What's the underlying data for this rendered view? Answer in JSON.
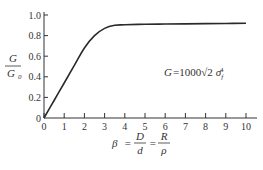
{
  "chart_data": {
    "type": "line",
    "title": "",
    "xlabel": "β = D/d = R/ρ",
    "ylabel": "G/G0",
    "xlim": [
      0,
      10
    ],
    "ylim": [
      0,
      1.0
    ],
    "grid": false,
    "legend": null,
    "x_ticks": [
      0,
      1,
      2,
      3,
      4,
      5,
      6,
      7,
      8,
      9,
      10
    ],
    "x_tick_labels": [
      "0",
      "1",
      "2",
      "3",
      "4",
      "5",
      "6",
      "7",
      "8",
      "9",
      "10"
    ],
    "y_ticks": [
      0,
      0.2,
      0.4,
      0.6,
      0.8,
      1.0
    ],
    "y_tick_labels": [
      "0",
      "0.2",
      "0.4",
      "0.6",
      "0.8",
      "1.0"
    ],
    "annotations": [
      "G = 1000√2 σf⁴"
    ],
    "series": [
      {
        "name": "G/G0",
        "x": [
          0,
          0.5,
          1.0,
          1.5,
          2.0,
          2.5,
          3.0,
          3.5,
          4.0,
          5.0,
          6.0,
          7.0,
          8.0,
          9.0,
          10.0
        ],
        "y": [
          0,
          0.17,
          0.34,
          0.51,
          0.68,
          0.8,
          0.87,
          0.9,
          0.905,
          0.91,
          0.912,
          0.914,
          0.916,
          0.918,
          0.92
        ]
      }
    ]
  },
  "labels": {
    "y_axis_num": "G",
    "y_axis_den": "G",
    "y_axis_den_sub": "0",
    "formula_lhs": "G",
    "formula_eq": "=",
    "formula_coef": "1000",
    "formula_sqrt": "√",
    "formula_root": "2",
    "formula_sigma": "σ",
    "formula_sub": "f",
    "formula_sup": "4",
    "x_beta": "β",
    "x_eq1": "=",
    "x_frac1_num": "D",
    "x_frac1_den": "d",
    "x_eq2": "=",
    "x_frac2_num": "R",
    "x_frac2_den": "ρ"
  }
}
